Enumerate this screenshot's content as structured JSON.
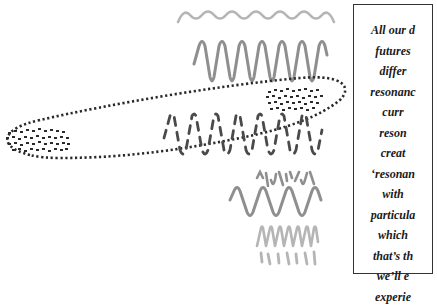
{
  "caption": {
    "lines": [
      "All our d",
      "futures",
      "differ",
      "resonanc",
      "curr",
      "reson",
      "creat",
      "‘resonan",
      "with",
      "particula",
      "which",
      "that’s th",
      "we’ll e",
      "experie"
    ]
  },
  "colors": {
    "background": "#ffffff",
    "wave_light": "#b5b5b5",
    "wave_mid": "#8f8f8f",
    "dots": "#2a2a2a",
    "caption_border": "#333333",
    "caption_text": "#1a1a1a"
  },
  "diagram": {
    "elements": [
      {
        "name": "top-smooth-wave",
        "style": "light gray, small amplitude",
        "cycles": 8
      },
      {
        "name": "tall-wave",
        "style": "medium gray, large amplitude",
        "cycles": 6
      },
      {
        "name": "dotted-ellipse",
        "style": "black dotted outline, elongated, tilted"
      },
      {
        "name": "dense-dot-cluster-left",
        "style": "black dash marks inside left end of ellipse"
      },
      {
        "name": "dense-dot-cluster-right",
        "style": "black dash marks inside right end of ellipse"
      },
      {
        "name": "broken-dashed-wave",
        "style": "dark gray dashed wave crossing ellipse"
      },
      {
        "name": "small-broken-wave",
        "style": "medium gray fragmented wave"
      },
      {
        "name": "medium-smooth-wave",
        "style": "medium gray smooth wave",
        "cycles": 7
      },
      {
        "name": "light-sharp-wave",
        "style": "light gray sharp-peaked wave"
      },
      {
        "name": "bottom-fragment-wave",
        "style": "light gray fragmented bottom wave"
      }
    ]
  }
}
